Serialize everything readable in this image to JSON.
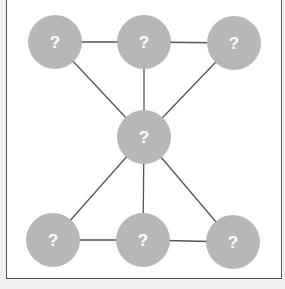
{
  "diagram": {
    "type": "graph",
    "node_color": "#b7b7b7",
    "edge_color": "#555555",
    "label_color": "#ffffff",
    "nodes": [
      {
        "id": "top-left",
        "label": "?",
        "x": 55,
        "y": 42
      },
      {
        "id": "top-middle",
        "label": "?",
        "x": 144,
        "y": 42
      },
      {
        "id": "top-right",
        "label": "?",
        "x": 234,
        "y": 43
      },
      {
        "id": "center",
        "label": "?",
        "x": 144,
        "y": 137
      },
      {
        "id": "bottom-left",
        "label": "?",
        "x": 53,
        "y": 240
      },
      {
        "id": "bottom-middle",
        "label": "?",
        "x": 143,
        "y": 240
      },
      {
        "id": "bottom-right",
        "label": "?",
        "x": 233,
        "y": 242
      }
    ],
    "edges": [
      [
        "top-left",
        "top-middle"
      ],
      [
        "top-middle",
        "top-right"
      ],
      [
        "top-left",
        "center"
      ],
      [
        "top-middle",
        "center"
      ],
      [
        "top-right",
        "center"
      ],
      [
        "center",
        "bottom-left"
      ],
      [
        "center",
        "bottom-middle"
      ],
      [
        "center",
        "bottom-right"
      ],
      [
        "bottom-left",
        "bottom-middle"
      ],
      [
        "bottom-middle",
        "bottom-right"
      ]
    ]
  }
}
